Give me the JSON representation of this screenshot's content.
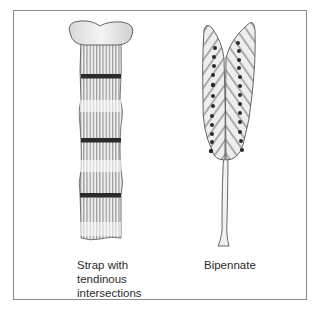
{
  "figure": {
    "panels": [
      {
        "id": "strap",
        "label_lines": [
          "Strap with",
          "tendinous",
          "intersections"
        ],
        "tendinous_bands": 3
      },
      {
        "id": "bipennate",
        "label_lines": [
          "Bipennate"
        ],
        "dots_per_side": 13
      }
    ]
  },
  "colors": {
    "border": "#8a8a8a",
    "fiber": "#9a9a9a",
    "band": "#2a2a2a",
    "bone": "#f2f2f2",
    "outline": "#555555"
  }
}
